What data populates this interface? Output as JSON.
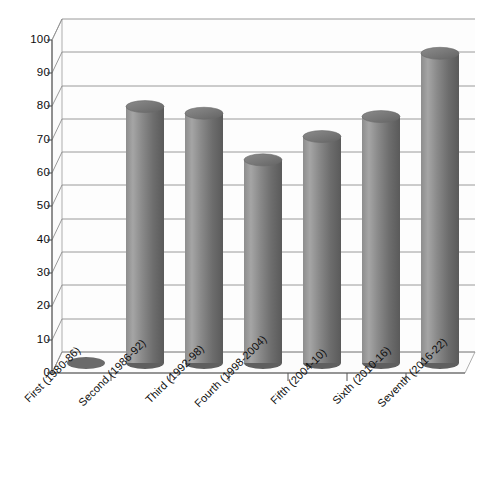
{
  "chart_data": {
    "type": "bar",
    "title": "",
    "subtitle": "",
    "xlabel": "",
    "ylabel": "",
    "categories": [
      "First (1980-86)",
      "Second (1986-92)",
      "Third (1992-98)",
      "Fourth (1998-2004)",
      "Fifth (2004-10)",
      "Sixth (2010-16)",
      "Seventh (2016-22)"
    ],
    "values": [
      0,
      77,
      75,
      61,
      68,
      74,
      93
    ],
    "ylim": [
      0,
      100
    ],
    "ytick_labels": [
      "0",
      "10",
      "20",
      "30",
      "40",
      "50",
      "60",
      "70",
      "80",
      "90",
      "100"
    ],
    "ytick_values": [
      0,
      10,
      20,
      30,
      40,
      50,
      60,
      70,
      80,
      90,
      100
    ],
    "grid": true,
    "legend": false,
    "legend_position": "none",
    "style": "3d-cylinder",
    "series": [
      {
        "name": "Series 1",
        "values": [
          0,
          77,
          75,
          61,
          68,
          74,
          93
        ],
        "color": "#808080"
      }
    ]
  },
  "colors": {
    "bar_fill_light": "#a8a8a8",
    "bar_fill_mid": "#7d7d7d",
    "bar_fill_dark": "#5e5e5e",
    "bar_top": "#6f6f6f",
    "gridline": "#8c8c8c",
    "axis": "#555555",
    "wall": "#fbfbfb",
    "floor": "#f7f7f7",
    "text": "#0d0d0d",
    "background": "#ffffff"
  },
  "caption": {
    "cropped_text": ""
  }
}
